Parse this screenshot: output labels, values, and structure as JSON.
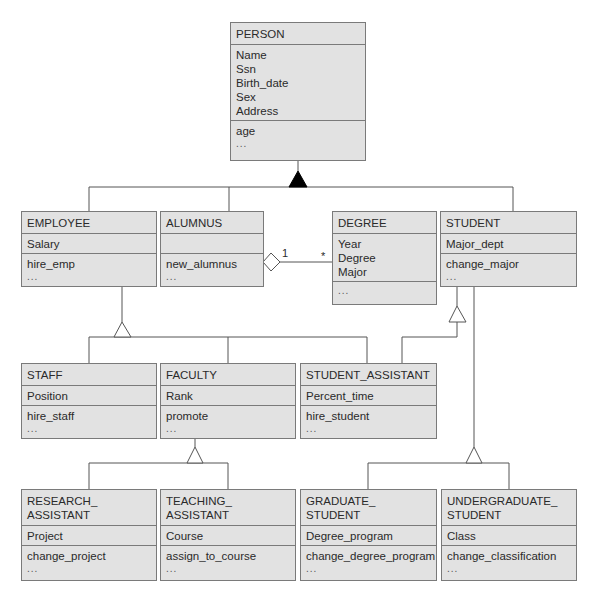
{
  "diagram": {
    "type": "UML class diagram",
    "classes": {
      "person": {
        "name": [
          "PERSON"
        ],
        "attributes": [
          "Name",
          "Ssn",
          "Birth_date",
          "Sex",
          "Address"
        ],
        "operations": [
          "age",
          "..."
        ]
      },
      "employee": {
        "name": [
          "EMPLOYEE"
        ],
        "attributes": [
          "Salary"
        ],
        "operations": [
          "hire_emp",
          "..."
        ]
      },
      "alumnus": {
        "name": [
          "ALUMNUS"
        ],
        "attributes": [],
        "operations": [
          "new_alumnus",
          "..."
        ]
      },
      "degree": {
        "name": [
          "DEGREE"
        ],
        "attributes": [
          "Year",
          "Degree",
          "Major"
        ],
        "operations": [
          "..."
        ]
      },
      "student": {
        "name": [
          "STUDENT"
        ],
        "attributes": [
          "Major_dept"
        ],
        "operations": [
          "change_major",
          "..."
        ]
      },
      "staff": {
        "name": [
          "STAFF"
        ],
        "attributes": [
          "Position"
        ],
        "operations": [
          "hire_staff",
          "..."
        ]
      },
      "faculty": {
        "name": [
          "FACULTY"
        ],
        "attributes": [
          "Rank"
        ],
        "operations": [
          "promote",
          "..."
        ]
      },
      "student_assistant": {
        "name": [
          "STUDENT_ASSISTANT"
        ],
        "attributes": [
          "Percent_time"
        ],
        "operations": [
          "hire_student",
          "..."
        ]
      },
      "research_assistant": {
        "name": [
          "RESEARCH_",
          "ASSISTANT"
        ],
        "attributes": [
          "Project"
        ],
        "operations": [
          "change_project",
          "..."
        ]
      },
      "teaching_assistant": {
        "name": [
          "TEACHING_",
          "ASSISTANT"
        ],
        "attributes": [
          "Course"
        ],
        "operations": [
          "assign_to_course",
          "..."
        ]
      },
      "graduate_student": {
        "name": [
          "GRADUATE_",
          "STUDENT"
        ],
        "attributes": [
          "Degree_program"
        ],
        "operations": [
          "change_degree_program",
          "..."
        ]
      },
      "undergraduate_student": {
        "name": [
          "UNDERGRADUATE_",
          "STUDENT"
        ],
        "attributes": [
          "Class"
        ],
        "operations": [
          "change_classification",
          "..."
        ]
      }
    },
    "association": {
      "from": "ALUMNUS",
      "to": "DEGREE",
      "kind": "aggregation",
      "multiplicity_from": "1",
      "multiplicity_to": "*"
    },
    "generalizations": [
      {
        "parent": "PERSON",
        "children": [
          "EMPLOYEE",
          "ALUMNUS",
          "STUDENT"
        ],
        "marker": "filled-triangle"
      },
      {
        "parent": "EMPLOYEE",
        "children": [
          "STAFF",
          "FACULTY",
          "STUDENT_ASSISTANT"
        ],
        "marker": "hollow-triangle"
      },
      {
        "parent": "STUDENT",
        "children": [
          "STUDENT_ASSISTANT"
        ],
        "marker": "hollow-triangle"
      },
      {
        "parent": "FACULTY",
        "children": [
          "RESEARCH_ASSISTANT",
          "TEACHING_ASSISTANT"
        ],
        "marker": "hollow-triangle"
      },
      {
        "parent": "STUDENT",
        "children": [
          "GRADUATE_STUDENT",
          "UNDERGRADUATE_STUDENT"
        ],
        "marker": "hollow-triangle"
      }
    ],
    "colors": {
      "box_fill": "#e2e2e2",
      "box_border": "#7a7a7a",
      "line": "#555555",
      "marker_fill": "#000000"
    }
  }
}
